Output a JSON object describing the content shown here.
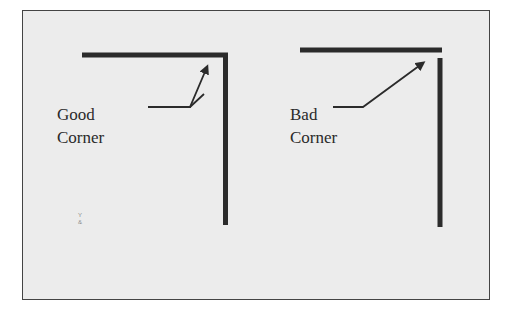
{
  "diagram": {
    "title": "",
    "colors": {
      "background": "#ececec",
      "frame": "#444444",
      "stroke": "#2b2b2b",
      "text": "#2a2a2a"
    },
    "panels": [
      {
        "id": "good",
        "label_line1": "Good",
        "label_line2": "Corner",
        "description": "Horizontal and vertical bars meet at a closed corner"
      },
      {
        "id": "bad",
        "label_line1": "Bad",
        "label_line2": "Corner",
        "description": "Horizontal bar overshoots and vertical bar starts below, leaving a gap"
      }
    ],
    "stray_mark": {
      "line1": "Y",
      "line2": "&"
    }
  }
}
